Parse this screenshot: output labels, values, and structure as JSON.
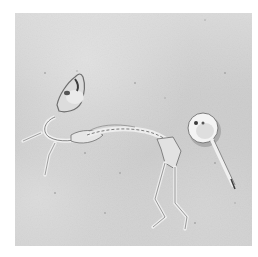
{
  "image": {
    "description": "Black-and-white photograph of an animal skeleton lying on sandy ground next to a key with a round head",
    "colors": {
      "border": "#ffffff",
      "sand": "#cfcfcf",
      "bone": "#eeeeee",
      "shadow": "#7a7a7a",
      "key_metal": "#f2f2f2"
    },
    "subjects": [
      {
        "name": "skeleton",
        "position": "left-center"
      },
      {
        "name": "key",
        "position": "right-center"
      }
    ]
  }
}
